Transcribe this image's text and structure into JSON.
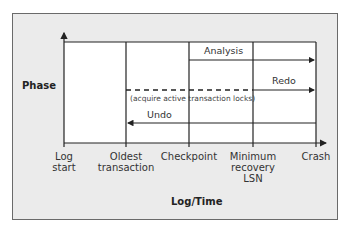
{
  "diagram": {
    "y_axis_title": "Phase",
    "x_axis_title": "Log/Time",
    "x_ticks": [
      {
        "label_line1": "Log",
        "label_line2": "start",
        "label_line3": ""
      },
      {
        "label_line1": "Oldest",
        "label_line2": "transaction",
        "label_line3": ""
      },
      {
        "label_line1": "Checkpoint",
        "label_line2": "",
        "label_line3": ""
      },
      {
        "label_line1": "Minimum",
        "label_line2": "recovery",
        "label_line3": "LSN"
      },
      {
        "label_line1": "Crash",
        "label_line2": "",
        "label_line3": ""
      }
    ],
    "phases": {
      "analysis": {
        "label": "Analysis",
        "from": "Checkpoint",
        "to": "Crash",
        "direction": "forward"
      },
      "redo": {
        "label": "Redo",
        "from": "Minimum recovery LSN",
        "to": "Crash",
        "direction": "forward",
        "dashed_from": "Oldest transaction",
        "note": "(acquire active transaction locks)"
      },
      "undo": {
        "label": "Undo",
        "from": "Crash",
        "to": "Oldest transaction",
        "direction": "backward"
      }
    },
    "colors": {
      "frame_bg": "#ebebeb",
      "frame_border": "#6a6a6a",
      "plot_bg": "#ffffff",
      "line": "#222222"
    }
  }
}
